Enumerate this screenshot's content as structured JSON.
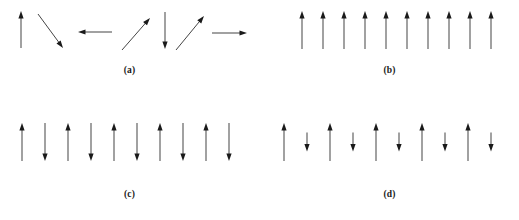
{
  "figure": {
    "background_color": "#ffffff",
    "arrow_color": "#3a3a3a",
    "arrow_head_color": "#1a1a1a",
    "width": 519,
    "height": 220
  },
  "panels": [
    {
      "id": "a",
      "label": "(a)",
      "arrangement": "random",
      "arrow_count": 7,
      "arrows": [
        {
          "x1": 21,
          "y1": 48,
          "x2": 21,
          "y2": 11,
          "angle_deg": 90
        },
        {
          "x1": 38,
          "y1": 14,
          "x2": 63,
          "y2": 48,
          "angle_deg": -54
        },
        {
          "x1": 112,
          "y1": 32,
          "x2": 78,
          "y2": 32,
          "angle_deg": 180
        },
        {
          "x1": 122,
          "y1": 50,
          "x2": 150,
          "y2": 18,
          "angle_deg": 49
        },
        {
          "x1": 165,
          "y1": 12,
          "x2": 165,
          "y2": 49,
          "angle_deg": -90
        },
        {
          "x1": 176,
          "y1": 50,
          "x2": 204,
          "y2": 16,
          "angle_deg": 51
        },
        {
          "x1": 212,
          "y1": 33,
          "x2": 247,
          "y2": 33,
          "angle_deg": 0
        }
      ]
    },
    {
      "id": "b",
      "label": "(b)",
      "arrangement": "parallel-aligned",
      "arrow_count": 10,
      "arrows": [
        {
          "x": 42,
          "dir": "up",
          "length": 38
        },
        {
          "x": 63,
          "dir": "up",
          "length": 38
        },
        {
          "x": 84,
          "dir": "up",
          "length": 38
        },
        {
          "x": 105,
          "dir": "up",
          "length": 38
        },
        {
          "x": 126,
          "dir": "up",
          "length": 38
        },
        {
          "x": 147,
          "dir": "up",
          "length": 38
        },
        {
          "x": 168,
          "dir": "up",
          "length": 38
        },
        {
          "x": 189,
          "dir": "up",
          "length": 38
        },
        {
          "x": 210,
          "dir": "up",
          "length": 38
        },
        {
          "x": 231,
          "dir": "up",
          "length": 38
        }
      ]
    },
    {
      "id": "c",
      "label": "(c)",
      "arrangement": "antiparallel-equal",
      "arrow_count": 10,
      "arrows": [
        {
          "x": 22,
          "dir": "up",
          "length": 38
        },
        {
          "x": 45,
          "dir": "down",
          "length": 38
        },
        {
          "x": 68,
          "dir": "up",
          "length": 38
        },
        {
          "x": 91,
          "dir": "down",
          "length": 38
        },
        {
          "x": 114,
          "dir": "up",
          "length": 38
        },
        {
          "x": 137,
          "dir": "down",
          "length": 38
        },
        {
          "x": 160,
          "dir": "up",
          "length": 38
        },
        {
          "x": 183,
          "dir": "down",
          "length": 38
        },
        {
          "x": 206,
          "dir": "up",
          "length": 38
        },
        {
          "x": 229,
          "dir": "down",
          "length": 38
        }
      ]
    },
    {
      "id": "d",
      "label": "(d)",
      "arrangement": "antiparallel-unequal",
      "arrow_count": 10,
      "arrows": [
        {
          "x": 24,
          "dir": "up",
          "length": 38
        },
        {
          "x": 47,
          "dir": "down",
          "length": 19
        },
        {
          "x": 70,
          "dir": "up",
          "length": 38
        },
        {
          "x": 93,
          "dir": "down",
          "length": 19
        },
        {
          "x": 116,
          "dir": "up",
          "length": 38
        },
        {
          "x": 139,
          "dir": "down",
          "length": 19
        },
        {
          "x": 162,
          "dir": "up",
          "length": 38
        },
        {
          "x": 185,
          "dir": "down",
          "length": 19
        },
        {
          "x": 208,
          "dir": "up",
          "length": 38
        },
        {
          "x": 231,
          "dir": "down",
          "length": 19
        }
      ]
    }
  ]
}
